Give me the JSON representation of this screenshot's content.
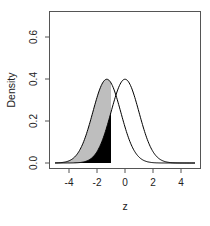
{
  "chart_data": {
    "type": "area",
    "title": "",
    "xlabel": "z",
    "ylabel": "Density",
    "xlim": [
      -5.5,
      5.5
    ],
    "ylim": [
      0,
      0.7
    ],
    "x_ticks": [
      -4,
      -2,
      0,
      2,
      4
    ],
    "x_tick_labels": [
      "-4",
      "-2",
      "0",
      "2",
      "4"
    ],
    "y_ticks": [
      0.0,
      0.2,
      0.4,
      0.6
    ],
    "y_tick_labels": [
      "0.0",
      "0.2",
      "0.4",
      "0.6"
    ],
    "grid": false,
    "legend": null,
    "x_range": [
      -5,
      5
    ],
    "series": [
      {
        "name": "shifted normal",
        "distribution": "normal",
        "mean": -1.3,
        "sd": 1,
        "peak_density": 0.4,
        "line_color": "#000000"
      },
      {
        "name": "standard normal",
        "distribution": "normal",
        "mean": 0,
        "sd": 1,
        "peak_density": 0.4,
        "line_color": "#000000"
      }
    ],
    "shaded_regions": [
      {
        "under_series": "shifted normal",
        "from": -5,
        "to": -1,
        "fill": "#bebebe"
      },
      {
        "under_series": "standard normal",
        "from": -5,
        "to": -1,
        "fill": "#000000"
      }
    ]
  }
}
